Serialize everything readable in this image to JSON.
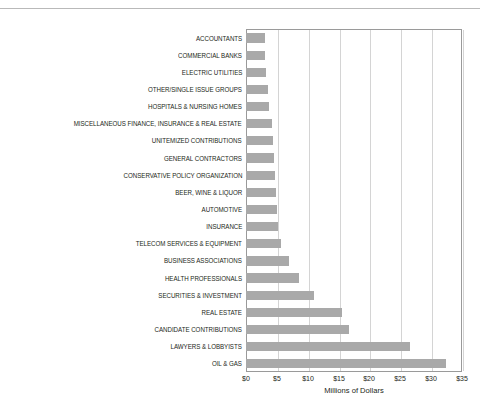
{
  "chart_data": {
    "type": "bar",
    "orientation": "horizontal",
    "title": "",
    "xlabel": "Millions of Dollars",
    "ylabel": "",
    "xlim": [
      0,
      35
    ],
    "xticks": [
      "$0",
      "$5",
      "$10",
      "$15",
      "$20",
      "$25",
      "$30",
      "$35"
    ],
    "xtick_values": [
      0,
      5,
      10,
      15,
      20,
      25,
      30,
      35
    ],
    "grid": true,
    "legend": false,
    "bar_color": "#a9a9a9",
    "categories": [
      "ACCOUNTANTS",
      "COMMERCIAL BANKS",
      "ELECTRIC UTILITIES",
      "OTHER/SINGLE ISSUE GROUPS",
      "HOSPITALS & NURSING HOMES",
      "MISCELLANEOUS FINANCE, INSURANCE & REAL ESTATE",
      "UNITEMIZED CONTRIBUTIONS",
      "GENERAL CONTRACTORS",
      "CONSERVATIVE POLICY ORGANIZATION",
      "BEER, WINE & LIQUOR",
      "AUTOMOTIVE",
      "INSURANCE",
      "TELECOM SERVICES & EQUIPMENT",
      "BUSINESS ASSOCIATIONS",
      "HEALTH PROFESSIONALS",
      "SECURITIES & INVESTMENT",
      "REAL ESTATE",
      "CANDIDATE CONTRIBUTIONS",
      "LAWYERS & LOBBYISTS",
      "OIL & GAS"
    ],
    "values": [
      3.0,
      3.1,
      3.2,
      3.6,
      3.8,
      4.2,
      4.4,
      4.6,
      4.7,
      4.8,
      5.0,
      5.2,
      5.6,
      7.0,
      8.6,
      11.0,
      15.6,
      16.7,
      26.6,
      32.4
    ]
  }
}
